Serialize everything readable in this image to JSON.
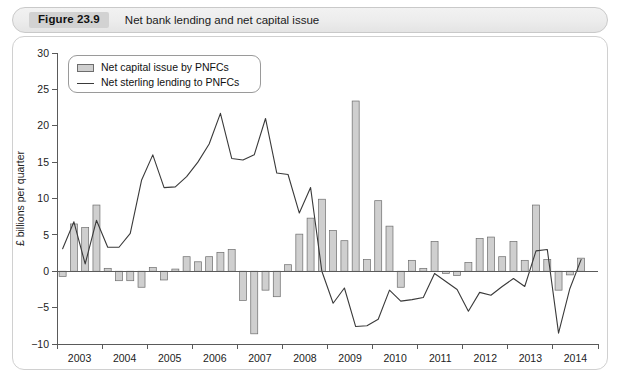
{
  "header": {
    "badge": "Figure 23.9",
    "title": "Net bank lending and net capital issue"
  },
  "legend": {
    "bar_label": "Net capital issue by PNFCs",
    "line_label": "Net sterling lending to PNFCs"
  },
  "chart_data": {
    "type": "bar",
    "title": "Net bank lending and net capital issue",
    "xlabel": "",
    "ylabel": "£ billions per quarter",
    "ylim": [
      -10,
      30
    ],
    "yticks": [
      -10,
      -5,
      0,
      5,
      10,
      15,
      20,
      25,
      30
    ],
    "ytick_labels": [
      "−10",
      "−5",
      "0",
      "5",
      "10",
      "15",
      "20",
      "25",
      "30"
    ],
    "xticks": [
      2003,
      2004,
      2005,
      2006,
      2007,
      2008,
      2009,
      2010,
      2011,
      2012,
      2013,
      2014,
      2015
    ],
    "xtick_labels": [
      "2003",
      "2004",
      "2005",
      "2006",
      "2007",
      "2008",
      "2009",
      "2010",
      "2011",
      "2012",
      "2013",
      "2014"
    ],
    "grid": false,
    "legend_position": "top-left",
    "x": [
      "2003Q1",
      "2003Q2",
      "2003Q3",
      "2003Q4",
      "2004Q1",
      "2004Q2",
      "2004Q3",
      "2004Q4",
      "2005Q1",
      "2005Q2",
      "2005Q3",
      "2005Q4",
      "2006Q1",
      "2006Q2",
      "2006Q3",
      "2006Q4",
      "2007Q1",
      "2007Q2",
      "2007Q3",
      "2007Q4",
      "2008Q1",
      "2008Q2",
      "2008Q3",
      "2008Q4",
      "2009Q1",
      "2009Q2",
      "2009Q3",
      "2009Q4",
      "2010Q1",
      "2010Q2",
      "2010Q3",
      "2010Q4",
      "2011Q1",
      "2011Q2",
      "2011Q3",
      "2011Q4",
      "2012Q1",
      "2012Q2",
      "2012Q3",
      "2012Q4",
      "2013Q1",
      "2013Q2",
      "2013Q3",
      "2013Q4",
      "2014Q1",
      "2014Q2",
      "2014Q3"
    ],
    "series": [
      {
        "name": "Net capital issue by PNFCs",
        "type": "bar",
        "color": "#cfcfcf",
        "edge_color": "#6d6d6d",
        "values": [
          -0.7,
          6.5,
          6.0,
          9.1,
          0.4,
          -1.3,
          -1.3,
          -2.2,
          0.5,
          -1.2,
          0.3,
          2.0,
          1.3,
          2.0,
          2.6,
          3.0,
          -4.0,
          -8.6,
          -2.6,
          -3.5,
          0.9,
          5.1,
          7.3,
          9.9,
          5.6,
          4.2,
          23.4,
          1.6,
          9.7,
          6.2,
          -2.2,
          1.5,
          0.4,
          4.1,
          -0.3,
          -0.6,
          1.2,
          4.5,
          4.7,
          2.0,
          4.1,
          1.5,
          9.1,
          1.6,
          -2.6,
          -0.5,
          1.8
        ]
      },
      {
        "name": "Net sterling lending to PNFCs",
        "type": "line",
        "color": "#3a3a3a",
        "values": [
          3.1,
          6.8,
          1.0,
          7.0,
          3.3,
          3.3,
          5.2,
          12.5,
          16.0,
          11.5,
          11.6,
          13.0,
          15.0,
          17.5,
          21.7,
          15.5,
          15.3,
          16.0,
          21.0,
          13.5,
          13.3,
          8.0,
          11.5,
          0.0,
          -4.4,
          -2.3,
          -7.6,
          -7.5,
          -6.6,
          -2.6,
          -4.1,
          -3.9,
          -3.6,
          -0.3,
          -1.4,
          -2.5,
          -5.5,
          -2.9,
          -3.3,
          -2.1,
          -1.0,
          -2.1,
          2.8,
          3.0,
          -8.5,
          -2.4,
          1.6
        ]
      }
    ]
  }
}
